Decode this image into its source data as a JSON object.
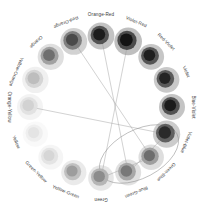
{
  "diagram": {
    "type": "radial-node-graph",
    "background": "#ffffff",
    "center": {
      "x": 101,
      "y": 107
    },
    "ring_radius": 71,
    "label_radius": 92,
    "node_count": 16,
    "nodes": [
      {
        "index": 0,
        "label": "Orange-Red",
        "angle_deg": -90,
        "core": "#1c1c1c",
        "mid": "#4d4d4d",
        "outer": "#b9b9b9",
        "r_core": 6.0,
        "r_mid": 9.2,
        "r_outer": 13.4
      },
      {
        "index": 1,
        "label": "Violet-Red",
        "angle_deg": -67.5,
        "core": "#141414",
        "mid": "#454545",
        "outer": "#b4b4b4",
        "r_core": 6.4,
        "r_mid": 9.6,
        "r_outer": 13.8
      },
      {
        "index": 2,
        "label": "Red-Violet",
        "angle_deg": -45,
        "core": "#1e1e1e",
        "mid": "#4f4f4f",
        "outer": "#bcbcbc",
        "r_core": 5.8,
        "r_mid": 8.9,
        "r_outer": 12.9
      },
      {
        "index": 3,
        "label": "Violet",
        "angle_deg": -22.5,
        "core": "#242424",
        "mid": "#555555",
        "outer": "#c0c0c0",
        "r_core": 5.7,
        "r_mid": 8.8,
        "r_outer": 12.8
      },
      {
        "index": 4,
        "label": "Blue-Violet",
        "angle_deg": 0,
        "core": "#1b1b1b",
        "mid": "#4c4c4c",
        "outer": "#bababa",
        "r_core": 5.9,
        "r_mid": 9.0,
        "r_outer": 13.0
      },
      {
        "index": 5,
        "label": "Violet-Blue",
        "angle_deg": 22.5,
        "core": "#2a2a2a",
        "mid": "#5b5b5b",
        "outer": "#c3c3c3",
        "r_core": 6.2,
        "r_mid": 9.4,
        "r_outer": 13.6
      },
      {
        "index": 6,
        "label": "Green-Blue",
        "angle_deg": 45,
        "core": "#6d6d6d",
        "mid": "#9b9b9b",
        "outer": "#d8d8d8",
        "r_core": 5.6,
        "r_mid": 8.7,
        "r_outer": 12.7
      },
      {
        "index": 7,
        "label": "Blue-Green",
        "angle_deg": 67.5,
        "core": "#787878",
        "mid": "#a4a4a4",
        "outer": "#dcdcdc",
        "r_core": 5.8,
        "r_mid": 8.9,
        "r_outer": 13.0
      },
      {
        "index": 8,
        "label": "Green",
        "angle_deg": 90,
        "core": "#8c8c8c",
        "mid": "#b2b2b2",
        "outer": "#e2e2e2",
        "r_core": 5.7,
        "r_mid": 8.8,
        "r_outer": 12.8
      },
      {
        "index": 9,
        "label": "Yellow-Green",
        "angle_deg": 112.5,
        "core": "#9d9d9d",
        "mid": "#bebebe",
        "outer": "#e6e6e6",
        "r_core": 5.6,
        "r_mid": 8.6,
        "r_outer": 12.6
      },
      {
        "index": 10,
        "label": "Green-Yellow",
        "angle_deg": 135,
        "core": "#d6d6d6",
        "mid": "#e3e3e3",
        "outer": "#f3f3f3",
        "r_core": 5.5,
        "r_mid": 8.5,
        "r_outer": 12.4
      },
      {
        "index": 11,
        "label": "Yellow",
        "angle_deg": 157.5,
        "core": "#e4e4e4",
        "mid": "#eeeeee",
        "outer": "#f8f8f8",
        "r_core": 5.6,
        "r_mid": 8.6,
        "r_outer": 12.6
      },
      {
        "index": 12,
        "label": "Orange-Yellow",
        "angle_deg": 180,
        "core": "#d2d2d2",
        "mid": "#e0e0e0",
        "outer": "#f1f1f1",
        "r_core": 5.8,
        "r_mid": 8.9,
        "r_outer": 13.0
      },
      {
        "index": 13,
        "label": "Yellow-Orange",
        "angle_deg": 202.5,
        "core": "#bdbdbd",
        "mid": "#d3d3d3",
        "outer": "#ededed",
        "r_core": 6.0,
        "r_mid": 9.1,
        "r_outer": 13.2
      },
      {
        "index": 14,
        "label": "Orange",
        "angle_deg": 225,
        "core": "#6f6f6f",
        "mid": "#9d9d9d",
        "outer": "#d9d9d9",
        "r_core": 5.9,
        "r_mid": 9.0,
        "r_outer": 13.1
      },
      {
        "index": 15,
        "label": "Red-Orange",
        "angle_deg": 247.5,
        "core": "#4a4a4a",
        "mid": "#7b7b7b",
        "outer": "#cacaca",
        "r_core": 6.1,
        "r_mid": 9.3,
        "r_outer": 13.4
      }
    ],
    "edges": [
      {
        "from": 15,
        "to": 6
      },
      {
        "from": 0,
        "to": 7
      },
      {
        "from": 1,
        "to": 8
      },
      {
        "from": 12,
        "to": 5
      },
      {
        "from": 6,
        "to": 8
      },
      {
        "from": 5,
        "to": 7
      }
    ],
    "hull": {
      "label": "cluster-outline",
      "cx": 139,
      "cy": 154,
      "rx": 43,
      "ry": 24,
      "rotate_deg": -28,
      "stroke": "#8d8d8d"
    },
    "palette": {
      "line": "#9a9a9a",
      "text": "#3b3b3b",
      "hull": "#8d8d8d"
    }
  }
}
